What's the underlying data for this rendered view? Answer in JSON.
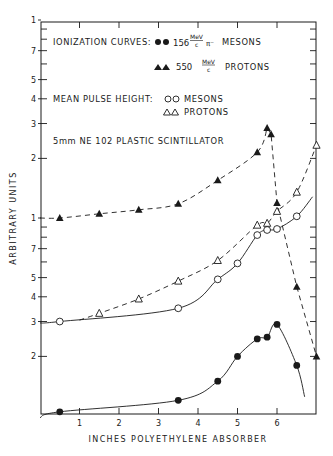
{
  "chart_data": {
    "type": "scatter",
    "title": "",
    "xlabel": "INCHES POLYETHYLENE ABSORBER",
    "ylabel": "ARBITRARY UNITS",
    "xscale": "linear",
    "yscale": "log",
    "xlim": [
      0,
      7
    ],
    "ylim": [
      0.1,
      10
    ],
    "x_ticks": [
      1,
      2,
      3,
      4,
      5,
      6
    ],
    "y_tick_labels": [
      {
        "value": 10,
        "label": "1"
      },
      {
        "value": 7,
        "label": "7"
      },
      {
        "value": 5,
        "label": "5"
      },
      {
        "value": 4,
        "label": "4"
      },
      {
        "value": 3,
        "label": "3"
      },
      {
        "value": 2,
        "label": "2"
      },
      {
        "value": 1,
        "label": "1"
      },
      {
        "value": 0.7,
        "label": "7"
      },
      {
        "value": 0.5,
        "label": "5"
      },
      {
        "value": 0.4,
        "label": "4"
      },
      {
        "value": 0.3,
        "label": "3"
      },
      {
        "value": 0.2,
        "label": "2"
      }
    ],
    "grid": false,
    "annotations": [
      "IONIZATION CURVES: ●● 156 MeV/c π⁻ MESONS",
      "▲▲ 550 MeV/c PROTONS",
      "MEAN PULSE HEIGHT: ○○ MESONS",
      "△△ PROTONS",
      "5mm NE 102 PLASTIC SCINTILLATOR"
    ],
    "series": [
      {
        "name": "Ionization curve: 156 MeV/c π⁻ mesons",
        "marker": "filled-circle",
        "line": "solid",
        "x": [
          0.5,
          3.5,
          4.5,
          5.0,
          5.5,
          5.75,
          6.0,
          6.5
        ],
        "y": [
          0.105,
          0.12,
          0.15,
          0.2,
          0.245,
          0.25,
          0.29,
          0.18
        ]
      },
      {
        "name": "Ionization curve: 550 MeV/c protons",
        "marker": "filled-triangle",
        "line": "dashed",
        "x": [
          0.5,
          1.5,
          2.5,
          3.5,
          4.5,
          5.5,
          5.75,
          5.85,
          6.0,
          6.5,
          7.0
        ],
        "y": [
          1.0,
          1.05,
          1.1,
          1.18,
          1.55,
          2.15,
          2.85,
          2.65,
          1.19,
          0.45,
          0.2
        ]
      },
      {
        "name": "Mean pulse height: mesons",
        "marker": "open-circle",
        "line": "solid",
        "x": [
          0.5,
          3.5,
          4.5,
          5.0,
          5.5,
          5.75,
          6.0,
          6.5
        ],
        "y": [
          0.3,
          0.35,
          0.49,
          0.59,
          0.82,
          0.87,
          0.88,
          1.02
        ]
      },
      {
        "name": "Mean pulse height: protons",
        "marker": "open-triangle",
        "line": "dashed",
        "x": [
          1.5,
          2.5,
          3.5,
          4.5,
          5.5,
          5.75,
          6.0,
          6.5,
          7.0
        ],
        "y": [
          0.33,
          0.39,
          0.48,
          0.61,
          0.92,
          0.94,
          1.08,
          1.35,
          2.33
        ]
      }
    ]
  },
  "labels": {
    "ylabel": "ARBITRARY UNITS",
    "xlabel": "INCHES POLYETHYLENE ABSORBER",
    "legend_ionization": "IONIZATION CURVES:",
    "legend_meson_energy": "156",
    "legend_proton_energy": "550",
    "legend_unit_num": "MeV",
    "legend_unit_den": "c",
    "legend_pion": "π⁻",
    "legend_mesons": "MESONS",
    "legend_protons": "PROTONS",
    "legend_pulse": "MEAN PULSE HEIGHT:",
    "legend_pulse_mesons": "MESONS",
    "legend_pulse_protons": "PROTONS",
    "scintillator": "5mm NE 102 PLASTIC SCINTILLATOR"
  }
}
